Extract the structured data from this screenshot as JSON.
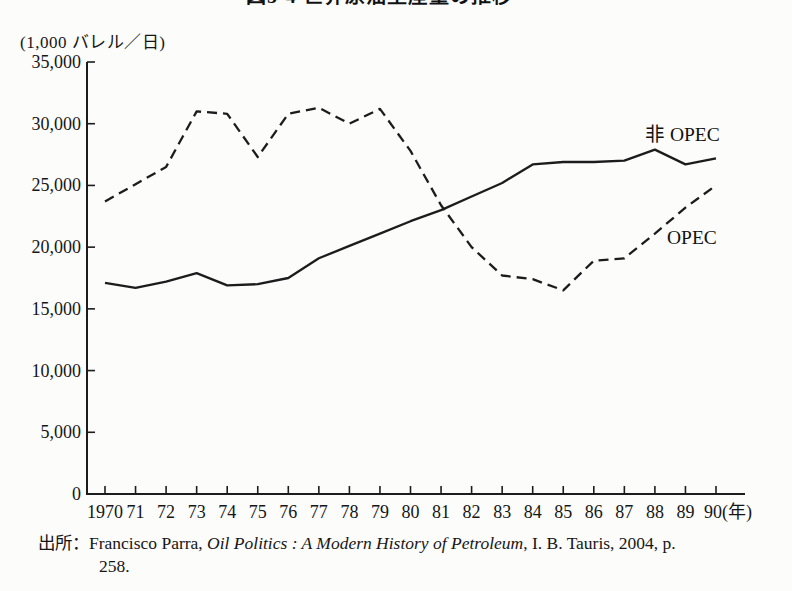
{
  "figure": {
    "title": "図5-4 世界原油生産量の推移"
  },
  "source": {
    "prefix": "出所：",
    "author": "Francisco Parra, ",
    "book_title": "Oil Politics : A Modern History of Petroleum",
    "publisher_info": ", I. B. Tauris, 2004, p.",
    "line2": "258."
  },
  "chart_data": {
    "type": "line",
    "title": "図5-4 世界原油生産量の推移",
    "unit_label": "(1,000 バレル／日)",
    "xlabel": "(年)",
    "ylabel": "(1,000 バレル／日)",
    "ylim": [
      0,
      35000
    ],
    "grid": false,
    "legend_position": "inline-right",
    "line_color": "#1c1c1c",
    "categories": [
      1970,
      1971,
      1972,
      1973,
      1974,
      1975,
      1976,
      1977,
      1978,
      1979,
      1980,
      1981,
      1982,
      1983,
      1984,
      1985,
      1986,
      1987,
      1988,
      1989,
      1990
    ],
    "x_tick_labels": [
      "1970",
      "71",
      "72",
      "73",
      "74",
      "75",
      "76",
      "77",
      "78",
      "79",
      "80",
      "81",
      "82",
      "83",
      "84",
      "85",
      "86",
      "87",
      "88",
      "89",
      "90(年)"
    ],
    "y_ticks": [
      0,
      5000,
      10000,
      15000,
      20000,
      25000,
      30000,
      35000
    ],
    "y_tick_labels": [
      "0",
      "5,000",
      "10,000",
      "15,000",
      "20,000",
      "25,000",
      "30,000",
      "35,000"
    ],
    "series": [
      {
        "name": "非 OPEC",
        "line_style": "solid",
        "values": [
          17100,
          16700,
          17200,
          17900,
          16900,
          17000,
          17500,
          19100,
          20100,
          21100,
          22100,
          23000,
          24100,
          25200,
          26700,
          26900,
          26900,
          27000,
          27900,
          26700,
          27200
        ]
      },
      {
        "name": "OPEC",
        "line_style": "dashed",
        "values": [
          23700,
          25100,
          26500,
          31000,
          30800,
          27300,
          30800,
          31300,
          30000,
          31200,
          27800,
          23400,
          20000,
          17700,
          17400,
          16500,
          18900,
          19100,
          21100,
          23200,
          25000
        ]
      }
    ]
  }
}
